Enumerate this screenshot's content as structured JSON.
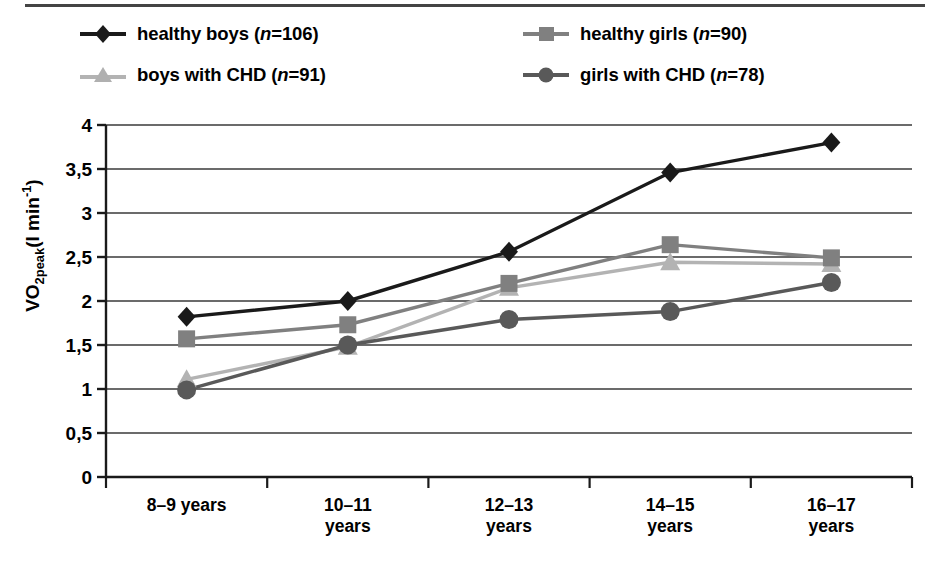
{
  "figure": {
    "background": "#ffffff",
    "top_rule_color": "#444444"
  },
  "legend": {
    "items": [
      {
        "label_text": "healthy boys (n=106)",
        "label_plain": "healthy boys (",
        "italic": "n",
        "label_tail": "=106)",
        "marker": "diamond-marker",
        "color": "#1a1a1a"
      },
      {
        "label_text": "healthy girls (n=90)",
        "label_plain": "healthy girls (",
        "italic": "n",
        "label_tail": "=90)",
        "marker": "square-marker",
        "color": "#808080"
      },
      {
        "label_text": "boys with CHD (n=91)",
        "label_plain": "boys with CHD (",
        "italic": "n",
        "label_tail": "=91)",
        "marker": "triangle-marker",
        "color": "#b3b3b3"
      },
      {
        "label_text": "girls with CHD (n=78)",
        "label_plain": "girls with CHD (",
        "italic": "n",
        "label_tail": "=78)",
        "marker": "circle-marker",
        "color": "#595959"
      }
    ]
  },
  "chart_data": {
    "type": "line",
    "title": "",
    "xlabel": "",
    "ylabel": "VO2peak(l min-1)",
    "ylabel_parts": {
      "pre": "VO",
      "sub": "2peak",
      "mid": "(l min",
      "sup": "-1",
      "post": ")"
    },
    "categories": [
      "8–9 years",
      "10–11\nyears",
      "12–13\nyears",
      "14–15\nyears",
      "16–17\nyears"
    ],
    "ytick_labels": [
      "0",
      "0,5",
      "1",
      "1,5",
      "2",
      "2,5",
      "3",
      "3,5",
      "4"
    ],
    "ytick_values": [
      0,
      0.5,
      1,
      1.5,
      2,
      2.5,
      3,
      3.5,
      4
    ],
    "ylim": [
      0,
      4
    ],
    "grid": true,
    "legend_position": "top",
    "series": [
      {
        "name": "healthy boys (n=106)",
        "marker": "diamond",
        "color": "#1a1a1a",
        "values": [
          1.82,
          2.0,
          2.56,
          3.46,
          3.8
        ]
      },
      {
        "name": "healthy girls (n=90)",
        "marker": "square",
        "color": "#808080",
        "values": [
          1.57,
          1.73,
          2.2,
          2.64,
          2.49
        ]
      },
      {
        "name": "boys with CHD (n=91)",
        "marker": "triangle",
        "color": "#b3b3b3",
        "values": [
          1.11,
          1.48,
          2.15,
          2.44,
          2.42
        ]
      },
      {
        "name": "girls with CHD (n=78)",
        "marker": "circle",
        "color": "#595959",
        "values": [
          0.99,
          1.5,
          1.79,
          1.88,
          2.21
        ]
      }
    ]
  }
}
